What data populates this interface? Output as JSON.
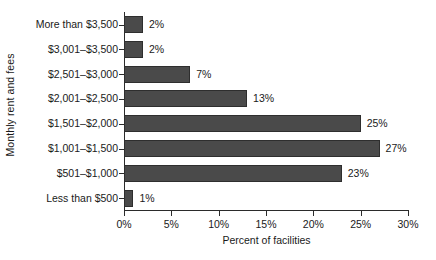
{
  "chart_data": {
    "type": "bar",
    "orientation": "horizontal",
    "title": "",
    "xlabel": "Percent of facilities",
    "ylabel": "Monthly rent and fees",
    "categories": [
      "More than $3,500",
      "$3,001–$3,500",
      "$2,501–$3,000",
      "$2,001–$2,500",
      "$1,501–$2,000",
      "$1,001–$1,500",
      "$501–$1,000",
      "Less than $500"
    ],
    "values": [
      2,
      2,
      7,
      13,
      25,
      27,
      23,
      1
    ],
    "value_labels": [
      "2%",
      "2%",
      "7%",
      "13%",
      "25%",
      "27%",
      "23%",
      "1%"
    ],
    "xlim": [
      0,
      30
    ],
    "xticks": [
      0,
      5,
      10,
      15,
      20,
      25,
      30
    ],
    "xtick_labels": [
      "0%",
      "5%",
      "10%",
      "15%",
      "20%",
      "25%",
      "30%"
    ],
    "grid": false,
    "legend": false,
    "bar_color": "#4a4a4a",
    "bar_edge_color": "#2e2e2e",
    "axis_color": "#2b2b2b",
    "background_color": "#ffffff"
  }
}
